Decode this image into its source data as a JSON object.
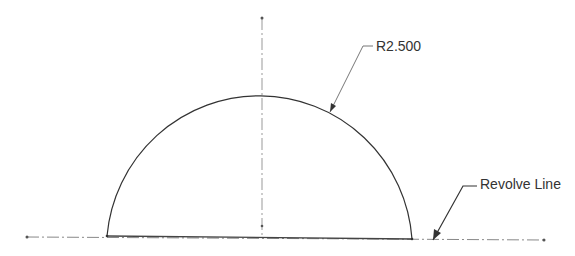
{
  "drawing": {
    "type": "sketch-revolve-profile",
    "shape": "semicircle",
    "colors": {
      "profile": "#333333",
      "centerline": "#888888",
      "leader": "#555555",
      "text": "#333333",
      "background": "#ffffff"
    }
  },
  "annotations": {
    "radius_dimension": "R2.500",
    "revolve_label": "Revolve Line"
  }
}
